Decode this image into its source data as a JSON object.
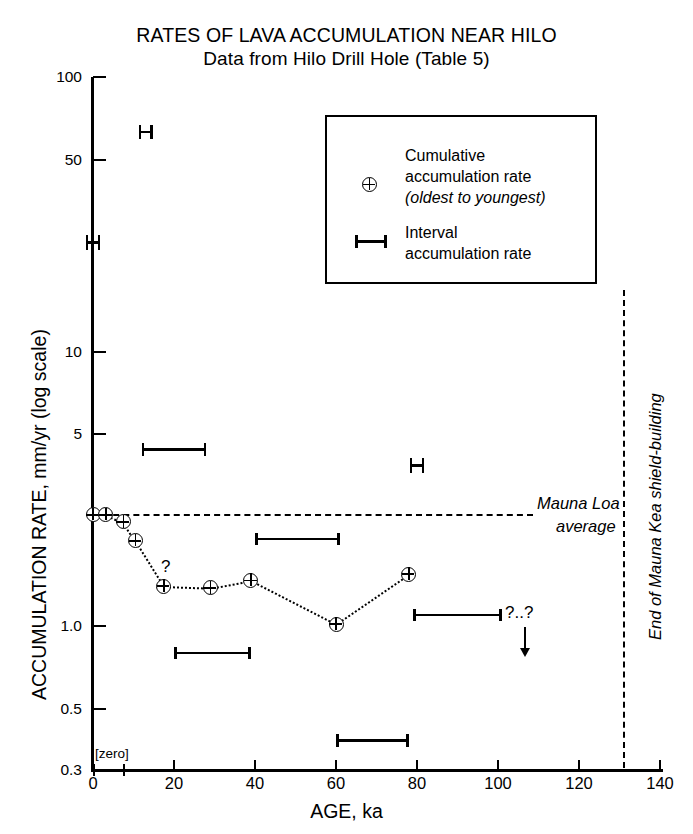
{
  "chart_data": {
    "type": "scatter",
    "title": "RATES OF LAVA ACCUMULATION NEAR HILO",
    "subtitle": "Data from Hilo Drill Hole (Table 5)",
    "xlabel": "AGE, ka",
    "ylabel": "ACCUMULATION RATE, mm/yr (log scale)",
    "xlim": [
      0,
      140
    ],
    "ylim": [
      0.3,
      100
    ],
    "yscale": "log",
    "grid": false,
    "xticks": [
      0,
      20,
      40,
      60,
      80,
      100,
      120,
      140
    ],
    "xticklabels": [
      "0",
      "20",
      "40",
      "60",
      "80",
      "100",
      "120",
      "140"
    ],
    "yticks": [
      100,
      50,
      10,
      5,
      1.0,
      0.5,
      0.3
    ],
    "yticklabels": [
      "100",
      "50",
      "10",
      "5",
      "1.0",
      "0.5",
      "0.3"
    ],
    "series": [
      {
        "name": "Cumulative accumulation rate",
        "marker": "circle-plus",
        "connector": "dotted",
        "points": [
          {
            "x": 0,
            "y": 2.55
          },
          {
            "x": 3.2,
            "y": 2.55
          },
          {
            "x": 7.5,
            "y": 2.4
          },
          {
            "x": 10.5,
            "y": 2.05
          },
          {
            "x": 17.5,
            "y": 1.4
          },
          {
            "x": 29,
            "y": 1.38
          },
          {
            "x": 39,
            "y": 1.47
          },
          {
            "x": 60,
            "y": 1.02
          },
          {
            "x": 78,
            "y": 1.55
          }
        ]
      },
      {
        "name": "Interval accumulation rate",
        "marker": "h-bar",
        "bars": [
          {
            "x0": 12,
            "x1": 28,
            "y": 4.4
          },
          {
            "x0": 40,
            "x1": 61,
            "y": 2.08
          },
          {
            "x0": 20,
            "x1": 39,
            "y": 0.8
          },
          {
            "x0": 60,
            "x1": 78,
            "y": 0.385
          },
          {
            "x0": 79,
            "x1": 101,
            "y": 1.1
          }
        ]
      },
      {
        "name": "Vertical-range markers",
        "marker": "h-vertical",
        "points": [
          {
            "x": 13,
            "y": 63
          },
          {
            "x": 0,
            "y": 25
          },
          {
            "x": 80,
            "y": 3.85
          }
        ]
      }
    ],
    "annotations": [
      {
        "name": "mauna-loa-average",
        "text_line1": "Mauna Loa",
        "text_line2": "average",
        "type": "hline",
        "y": 2.55,
        "style": "dashed"
      },
      {
        "name": "end-of-shield-building",
        "text": "End of Mauna Kea shield-building",
        "type": "vline",
        "x": 131,
        "style": "dashed"
      },
      {
        "name": "zero-interval",
        "text": "[zero]",
        "x0": 0,
        "x1": 8,
        "y": 0.3
      },
      {
        "name": "query-left",
        "text": "?"
      },
      {
        "name": "query-right",
        "text": "?..?"
      }
    ],
    "legend": {
      "position": "upper-right",
      "entries": [
        {
          "symbol": "circle-plus",
          "line1": "Cumulative",
          "line2": "accumulation rate",
          "line3": "(oldest to youngest)"
        },
        {
          "symbol": "h-bar",
          "line1": "Interval",
          "line2": "accumulation rate"
        }
      ]
    },
    "colors": {
      "ink": "#000000",
      "background": "#ffffff"
    }
  }
}
